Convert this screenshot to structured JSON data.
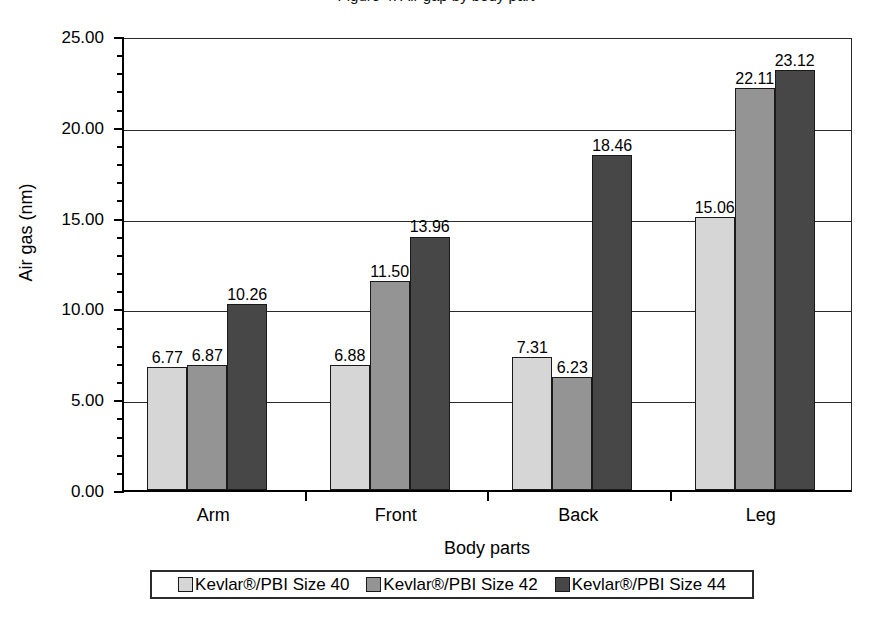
{
  "figure": {
    "cropped_top_caption": "Figure 4. Air gap by body part",
    "y_axis_title": "Air gas (nm)",
    "x_axis_title": "Body parts"
  },
  "chart_data": {
    "type": "bar",
    "title": "",
    "subtitle": "",
    "xlabel": "Body parts",
    "ylabel": "Air gas (nm)",
    "categories": [
      "Arm",
      "Front",
      "Back",
      "Leg"
    ],
    "series": [
      {
        "name": "Kevlar®/PBI Size 40",
        "color": "#d6d6d6",
        "values": [
          6.77,
          6.88,
          7.31,
          15.06
        ]
      },
      {
        "name": "Kevlar®/PBI Size 42",
        "color": "#949494",
        "values": [
          6.87,
          11.5,
          6.23,
          22.11
        ]
      },
      {
        "name": "Kevlar®/PBI Size 44",
        "color": "#474747",
        "values": [
          10.26,
          13.96,
          18.46,
          23.12
        ]
      }
    ],
    "data_labels": [
      [
        "6.77",
        "6.87",
        "10.26"
      ],
      [
        "6.88",
        "11.50",
        "13.96"
      ],
      [
        "7.31",
        "6.23",
        "18.46"
      ],
      [
        "15.06",
        "22.11",
        "23.12"
      ]
    ],
    "ylim": [
      0,
      25
    ],
    "ytick_values": [
      0,
      5,
      10,
      15,
      20,
      25
    ],
    "ytick_labels": [
      "0.00",
      "5.00",
      "10.00",
      "15.00",
      "20.00",
      "25.00"
    ],
    "y_minor_tick_interval": 1,
    "grid": {
      "horizontal_major": true,
      "vertical": false
    },
    "legend": {
      "position": "bottom",
      "boxed": true,
      "orientation": "horizontal"
    }
  },
  "legend_entries": [
    {
      "label": "Kevlar®/PBI Size 40",
      "swatch": "light-gray-swatch"
    },
    {
      "label": "Kevlar®/PBI Size 42",
      "swatch": "medium-gray-swatch"
    },
    {
      "label": "Kevlar®/PBI Size 44",
      "swatch": "dark-gray-swatch"
    }
  ]
}
